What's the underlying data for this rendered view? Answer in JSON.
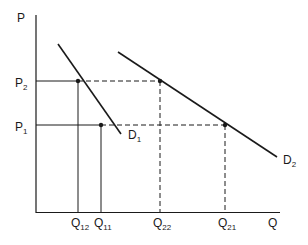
{
  "diagram": {
    "axes": {
      "y_label": "P",
      "x_label": "Q"
    },
    "price_levels": [
      {
        "label": "P",
        "sub": "2",
        "y": 81
      },
      {
        "label": "P",
        "sub": "1",
        "y": 125
      }
    ],
    "curves": [
      {
        "label": "D",
        "sub": "1",
        "x1": 58,
        "y1": 44,
        "x2": 121,
        "y2": 134
      },
      {
        "label": "D",
        "sub": "2",
        "x1": 118,
        "y1": 52,
        "x2": 277,
        "y2": 157
      }
    ],
    "quantity_marks": [
      {
        "label": "Q",
        "sub": "12",
        "x": 78
      },
      {
        "label": "Q",
        "sub": "11",
        "x": 101
      },
      {
        "label": "Q",
        "sub": "22",
        "x": 160
      },
      {
        "label": "Q",
        "sub": "21",
        "x": 225
      }
    ],
    "points": [
      {
        "name": "D1 at P2",
        "x": 78,
        "y": 81
      },
      {
        "name": "D1 at P1",
        "x": 101,
        "y": 125
      },
      {
        "name": "D2 at P2",
        "x": 160,
        "y": 81
      },
      {
        "name": "D2 at P1",
        "x": 225,
        "y": 125
      }
    ],
    "colors": {
      "ink": "#1a1a1a",
      "background": "#ffffff"
    }
  }
}
